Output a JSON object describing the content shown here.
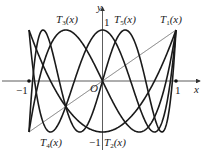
{
  "diagram": {
    "axes": {
      "x_label": "x",
      "y_label": "y",
      "origin_label": "O",
      "tick_labels": {
        "x_neg": "−1",
        "x_pos": "1",
        "y_pos": "1",
        "y_neg": "−1"
      }
    },
    "curve_labels": [
      {
        "name": "T",
        "index": "1",
        "arg": "(x)"
      },
      {
        "name": "T",
        "index": "2",
        "arg": "(x)"
      },
      {
        "name": "T",
        "index": "3",
        "arg": "(x)"
      },
      {
        "name": "T",
        "index": "4",
        "arg": "(x)"
      },
      {
        "name": "T",
        "index": "5",
        "arg": "(x)"
      }
    ],
    "colors": {
      "curve": "#1a1a1a",
      "axis": "#333333",
      "line": "#555555"
    }
  },
  "chart_data": {
    "type": "line",
    "title": "",
    "xlabel": "x",
    "ylabel": "y",
    "xlim": [
      -1,
      1
    ],
    "ylim": [
      -1,
      1
    ],
    "grid": false,
    "series": [
      {
        "name": "T1(x)",
        "formula": "x",
        "n": 1
      },
      {
        "name": "T2(x)",
        "formula": "2x^2-1",
        "n": 2
      },
      {
        "name": "T3(x)",
        "formula": "4x^3-3x",
        "n": 3
      },
      {
        "name": "T4(x)",
        "formula": "8x^4-8x^2+1",
        "n": 4
      },
      {
        "name": "T5(x)",
        "formula": "16x^5-20x^3+5x",
        "n": 5
      }
    ]
  }
}
